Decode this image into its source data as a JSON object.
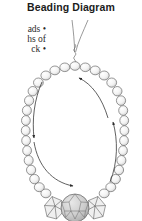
{
  "page": {
    "title": "Beading Diagram",
    "background_color": "#ffffff",
    "width": 142,
    "height": 221
  },
  "body_text": {
    "note": "left-column body copy clipped by the page edge",
    "lines": [
      "ads •",
      "hs of",
      "ck •"
    ]
  },
  "diagram": {
    "name": "beading-diagram",
    "colors": {
      "outline": "#555555",
      "bead_fill": "#f2f2f2",
      "bead_shade": "#d8d8d8",
      "crystal_fill": "#ededed",
      "focal_fill": "#c9c9c9",
      "thread": "#777777",
      "arrow": "#333333"
    },
    "parts": [
      {
        "name": "thread-tails",
        "label": "thread tails"
      },
      {
        "name": "thread-twist",
        "label": "twisted thread"
      },
      {
        "name": "bead-loop",
        "label": "round bead loop"
      },
      {
        "name": "crystal-bicone-left",
        "label": "left crystal bicone"
      },
      {
        "name": "crystal-bicone-right",
        "label": "right crystal bicone"
      },
      {
        "name": "focal-bead",
        "label": "faceted focal bead"
      },
      {
        "name": "direction-arrow-left",
        "label": "downward direction arrow"
      },
      {
        "name": "direction-arrow-bottom",
        "label": "rightward direction arrow"
      },
      {
        "name": "direction-arrow-right",
        "label": "upward direction arrow"
      },
      {
        "name": "direction-arrow-top",
        "label": "return direction arrow"
      }
    ]
  }
}
